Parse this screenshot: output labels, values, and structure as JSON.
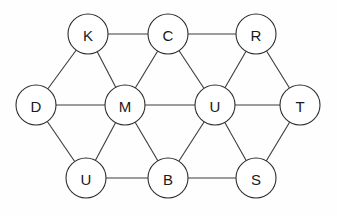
{
  "diagram": {
    "type": "graph",
    "node_radius": 20,
    "colors": {
      "stroke": "#2e2e2e",
      "fill": "#ffffff",
      "text": "#1a1a1a",
      "background": "#fefefe"
    },
    "nodes": [
      {
        "id": "n1",
        "label": "K",
        "x": 88,
        "y": 34
      },
      {
        "id": "n2",
        "label": "C",
        "x": 168,
        "y": 34
      },
      {
        "id": "n3",
        "label": "R",
        "x": 256,
        "y": 34
      },
      {
        "id": "n4",
        "label": "D",
        "x": 36,
        "y": 105
      },
      {
        "id": "n5",
        "label": "M",
        "x": 125,
        "y": 105
      },
      {
        "id": "n6",
        "label": "U",
        "x": 215,
        "y": 105
      },
      {
        "id": "n7",
        "label": "T",
        "x": 300,
        "y": 105
      },
      {
        "id": "n8",
        "label": "U",
        "x": 86,
        "y": 178
      },
      {
        "id": "n9",
        "label": "B",
        "x": 168,
        "y": 178
      },
      {
        "id": "n10",
        "label": "S",
        "x": 256,
        "y": 178
      }
    ],
    "edges": [
      [
        "n1",
        "n2"
      ],
      [
        "n2",
        "n3"
      ],
      [
        "n1",
        "n4"
      ],
      [
        "n1",
        "n5"
      ],
      [
        "n2",
        "n5"
      ],
      [
        "n2",
        "n6"
      ],
      [
        "n3",
        "n6"
      ],
      [
        "n3",
        "n7"
      ],
      [
        "n4",
        "n5"
      ],
      [
        "n5",
        "n6"
      ],
      [
        "n6",
        "n7"
      ],
      [
        "n4",
        "n8"
      ],
      [
        "n5",
        "n8"
      ],
      [
        "n5",
        "n9"
      ],
      [
        "n6",
        "n9"
      ],
      [
        "n6",
        "n10"
      ],
      [
        "n7",
        "n10"
      ],
      [
        "n8",
        "n9"
      ],
      [
        "n9",
        "n10"
      ]
    ]
  }
}
